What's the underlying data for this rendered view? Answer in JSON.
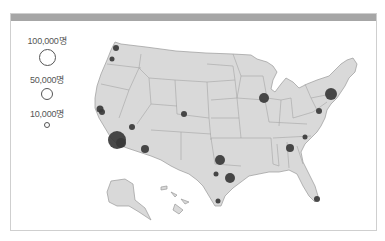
{
  "header": {
    "bar_color": "#a6a6a6"
  },
  "legend": {
    "title": "",
    "items": [
      {
        "label": "100,000명",
        "value": 100000,
        "diameter": 17
      },
      {
        "label": "50,000명",
        "value": 50000,
        "diameter": 12
      },
      {
        "label": "10,000명",
        "value": 10000,
        "diameter": 6
      }
    ]
  },
  "map": {
    "region": "United States",
    "land_color": "#d9d9d9",
    "border_color": "#9a9a9a",
    "bubble_color": "#3a3a3a",
    "bubbles": [
      {
        "name": "seattle",
        "x": 105,
        "y": 34,
        "r": 3
      },
      {
        "name": "portland",
        "x": 101,
        "y": 45,
        "r": 2.5
      },
      {
        "name": "san-francisco",
        "x": 89,
        "y": 95,
        "r": 3.5
      },
      {
        "name": "san-jose",
        "x": 91,
        "y": 98,
        "r": 3
      },
      {
        "name": "las-vegas",
        "x": 121,
        "y": 113,
        "r": 3
      },
      {
        "name": "los-angeles",
        "x": 106,
        "y": 126,
        "r": 9
      },
      {
        "name": "san-diego",
        "x": 110,
        "y": 129,
        "r": 5
      },
      {
        "name": "phoenix",
        "x": 134,
        "y": 135,
        "r": 4
      },
      {
        "name": "denver",
        "x": 173,
        "y": 100,
        "r": 3
      },
      {
        "name": "chicago",
        "x": 253,
        "y": 84,
        "r": 5
      },
      {
        "name": "new-york",
        "x": 320,
        "y": 80,
        "r": 6
      },
      {
        "name": "washington-dc",
        "x": 308,
        "y": 97,
        "r": 3
      },
      {
        "name": "charlotte",
        "x": 294,
        "y": 123,
        "r": 2.5
      },
      {
        "name": "atlanta",
        "x": 279,
        "y": 134,
        "r": 4
      },
      {
        "name": "dallas",
        "x": 209,
        "y": 146,
        "r": 5
      },
      {
        "name": "austin",
        "x": 205,
        "y": 160,
        "r": 2.5
      },
      {
        "name": "houston",
        "x": 219,
        "y": 164,
        "r": 5
      },
      {
        "name": "south-texas",
        "x": 207,
        "y": 187,
        "r": 2.5
      },
      {
        "name": "miami",
        "x": 306,
        "y": 185,
        "r": 3
      }
    ]
  }
}
